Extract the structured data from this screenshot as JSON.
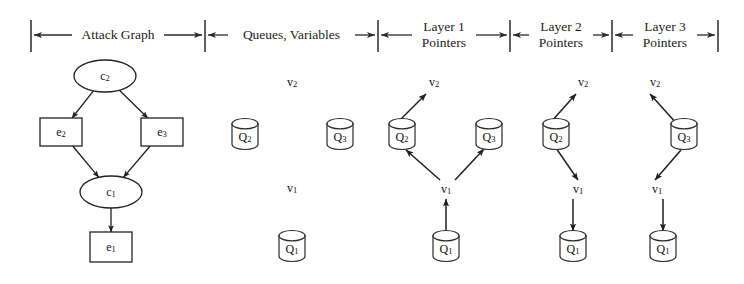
{
  "figure": {
    "background_color": "#ffffff",
    "ink_color": "#232323",
    "width": 744,
    "height": 284
  },
  "sections": [
    {
      "id": "attack-graph",
      "label": "Attack Graph",
      "label_line1": "Attack Graph",
      "label_line2": "",
      "x_start": 31,
      "x_end": 205
    },
    {
      "id": "queues-variables",
      "label": "Queues, Variables",
      "label_line1": "Queues, Variables",
      "label_line2": "",
      "x_start": 205,
      "x_end": 378
    },
    {
      "id": "layer-1-pointers",
      "label": "Layer 1 Pointers",
      "label_line1": "Layer 1",
      "label_line2": "Pointers",
      "x_start": 378,
      "x_end": 510
    },
    {
      "id": "layer-2-pointers",
      "label": "Layer 2 Pointers",
      "label_line1": "Layer 2",
      "label_line2": "Pointers",
      "x_start": 510,
      "x_end": 612
    },
    {
      "id": "layer-3-pointers",
      "label": "Layer 3 Pointers",
      "label_line1": "Layer 3",
      "label_line2": "Pointers",
      "x_start": 612,
      "x_end": 718
    }
  ],
  "attack_graph": {
    "nodes": [
      {
        "id": "c2",
        "base": "c",
        "subscript": "2",
        "shape": "ellipse",
        "cx": 105,
        "cy": 76,
        "rx": 31,
        "ry": 16
      },
      {
        "id": "e2",
        "base": "e",
        "subscript": "2",
        "shape": "rect",
        "cx": 61,
        "cy": 132,
        "w": 42,
        "h": 28
      },
      {
        "id": "e3",
        "base": "e",
        "subscript": "3",
        "shape": "rect",
        "cx": 162,
        "cy": 132,
        "w": 42,
        "h": 28
      },
      {
        "id": "c1",
        "base": "c",
        "subscript": "1",
        "shape": "ellipse",
        "cx": 111,
        "cy": 192,
        "rx": 31,
        "ry": 16
      },
      {
        "id": "e1",
        "base": "e",
        "subscript": "1",
        "shape": "rect",
        "cx": 111,
        "cy": 247,
        "w": 42,
        "h": 30
      }
    ],
    "edges": [
      {
        "from": "c2",
        "to": "e2"
      },
      {
        "from": "c2",
        "to": "e3"
      },
      {
        "from": "e2",
        "to": "c1"
      },
      {
        "from": "e3",
        "to": "c1"
      },
      {
        "from": "c1",
        "to": "e1"
      }
    ]
  },
  "panels": [
    {
      "id": "queues-variables",
      "queues": [
        {
          "id": "Q2",
          "base": "Q",
          "subscript": "2",
          "cx": 245,
          "cy": 134
        },
        {
          "id": "Q3",
          "base": "Q",
          "subscript": "3",
          "cx": 340,
          "cy": 134
        },
        {
          "id": "Q1",
          "base": "Q",
          "subscript": "1",
          "cx": 292,
          "cy": 246
        }
      ],
      "variables": [
        {
          "id": "v2",
          "base": "v",
          "subscript": "2",
          "cx": 292,
          "cy": 83
        },
        {
          "id": "v1",
          "base": "v",
          "subscript": "1",
          "cx": 292,
          "cy": 189
        }
      ],
      "pointers": []
    },
    {
      "id": "layer-1-pointers",
      "queues": [
        {
          "id": "Q2",
          "base": "Q",
          "subscript": "2",
          "cx": 402,
          "cy": 134
        },
        {
          "id": "Q3",
          "base": "Q",
          "subscript": "3",
          "cx": 489,
          "cy": 134
        },
        {
          "id": "Q1",
          "base": "Q",
          "subscript": "1",
          "cx": 446,
          "cy": 246
        }
      ],
      "variables": [
        {
          "id": "v2",
          "base": "v",
          "subscript": "2",
          "cx": 434,
          "cy": 83
        },
        {
          "id": "v1",
          "base": "v",
          "subscript": "1",
          "cx": 446,
          "cy": 190
        }
      ],
      "pointers": [
        {
          "from": "Q2",
          "to": "v2",
          "x1": 398,
          "y1": 122,
          "x2": 426,
          "y2": 94
        },
        {
          "from": "v1",
          "to": "Q2",
          "x1": 440,
          "y1": 180,
          "x2": 406,
          "y2": 150
        },
        {
          "from": "v1",
          "to": "Q3",
          "x1": 455,
          "y1": 180,
          "x2": 484,
          "y2": 149
        },
        {
          "from": "Q1",
          "to": "v1",
          "x1": 446,
          "y1": 230,
          "x2": 446,
          "y2": 199
        }
      ]
    },
    {
      "id": "layer-2-pointers",
      "queues": [
        {
          "id": "Q2",
          "base": "Q",
          "subscript": "2",
          "cx": 556,
          "cy": 134
        },
        {
          "id": "Q1",
          "base": "Q",
          "subscript": "1",
          "cx": 573,
          "cy": 246
        }
      ],
      "variables": [
        {
          "id": "v2",
          "base": "v",
          "subscript": "2",
          "cx": 583,
          "cy": 83
        },
        {
          "id": "v1",
          "base": "v",
          "subscript": "1",
          "cx": 578,
          "cy": 190
        }
      ],
      "pointers": [
        {
          "from": "Q2",
          "to": "v2",
          "x1": 551,
          "y1": 122,
          "x2": 576,
          "y2": 94
        },
        {
          "from": "Q2",
          "to": "v1",
          "x1": 556,
          "y1": 148,
          "x2": 578,
          "y2": 180
        },
        {
          "from": "v1",
          "to": "Q1",
          "x1": 573,
          "y1": 199,
          "x2": 573,
          "y2": 231
        }
      ]
    },
    {
      "id": "layer-3-pointers",
      "queues": [
        {
          "id": "Q3",
          "base": "Q",
          "subscript": "3",
          "cx": 684,
          "cy": 134
        },
        {
          "id": "Q1",
          "base": "Q",
          "subscript": "1",
          "cx": 663,
          "cy": 246
        }
      ],
      "variables": [
        {
          "id": "v2",
          "base": "v",
          "subscript": "2",
          "cx": 655,
          "cy": 83
        },
        {
          "id": "v1",
          "base": "v",
          "subscript": "1",
          "cx": 657,
          "cy": 190
        }
      ],
      "pointers": [
        {
          "from": "Q3",
          "to": "v2",
          "x1": 677,
          "y1": 124,
          "x2": 650,
          "y2": 94
        },
        {
          "from": "Q3",
          "to": "v1",
          "x1": 681,
          "y1": 150,
          "x2": 655,
          "y2": 180
        },
        {
          "from": "v1",
          "to": "Q1",
          "x1": 663,
          "y1": 199,
          "x2": 663,
          "y2": 231
        }
      ]
    }
  ]
}
